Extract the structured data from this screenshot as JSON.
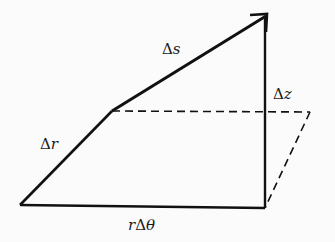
{
  "diagram": {
    "labels": {
      "delta_s": {
        "delta": "Δ",
        "var": "s"
      },
      "delta_z": {
        "delta": "Δ",
        "var": "z"
      },
      "delta_r": {
        "delta": "Δ",
        "var": "r"
      },
      "r_delta_theta": {
        "pre": "r",
        "delta": "Δ",
        "var": "θ"
      }
    },
    "colors": {
      "line": "#111111",
      "background": "#fbfbfb"
    }
  }
}
